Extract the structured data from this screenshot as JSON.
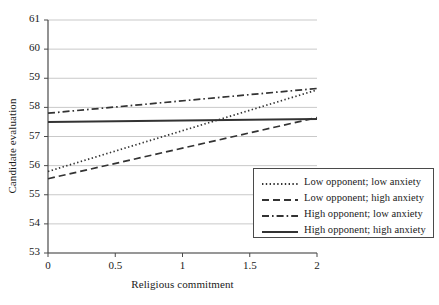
{
  "chart_data": {
    "type": "line",
    "title": "",
    "xlabel": "Religious commitment",
    "ylabel": "Candidate evaluation",
    "xlim": [
      0,
      2
    ],
    "ylim": [
      53,
      61
    ],
    "xticks": [
      "0",
      "0.5",
      "1",
      "1.5",
      "2"
    ],
    "xtick_values": [
      0,
      0.5,
      1,
      1.5,
      2
    ],
    "yticks": [
      "53",
      "54",
      "55",
      "56",
      "57",
      "58",
      "59",
      "60",
      "61"
    ],
    "ytick_values": [
      53,
      54,
      55,
      56,
      57,
      58,
      59,
      60,
      61
    ],
    "grid": "horizontal",
    "legend_position": "bottom-right",
    "x": [
      0,
      2
    ],
    "series": [
      {
        "name": "Low opponent; low anxiety",
        "style": "dotted",
        "color": "#333333",
        "values": [
          55.8,
          58.6
        ]
      },
      {
        "name": "Low opponent; high anxiety",
        "style": "dashed",
        "color": "#333333",
        "values": [
          55.55,
          57.65
        ]
      },
      {
        "name": "High opponent; low anxiety",
        "style": "dash-dot",
        "color": "#333333",
        "values": [
          57.8,
          58.65
        ]
      },
      {
        "name": "High opponent; high anxiety",
        "style": "solid",
        "color": "#333333",
        "values": [
          57.5,
          57.6
        ]
      }
    ]
  },
  "legend": {
    "items": [
      {
        "label": "Low opponent; low anxiety",
        "style": "dotted"
      },
      {
        "label": "Low opponent; high anxiety",
        "style": "dashed"
      },
      {
        "label": "High opponent; low anxiety",
        "style": "dash-dot"
      },
      {
        "label": "High opponent; high anxiety",
        "style": "solid"
      }
    ]
  },
  "axes": {
    "y_title": "Candidate evaluation",
    "x_title": "Religious commitment"
  },
  "colors": {
    "line": "#333333",
    "grid": "#c9c9c9",
    "axis": "#4a4a4a",
    "text": "#1a1a1a",
    "background": "#ffffff"
  }
}
